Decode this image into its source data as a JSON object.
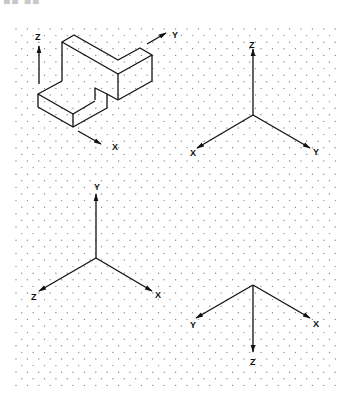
{
  "header": {
    "title_fragment": "■■ ■■"
  },
  "colors": {
    "ink": "#111111",
    "grid_dot": "#8a8a8a",
    "background": "#ffffff"
  },
  "figure": {
    "object_view": {
      "description": "isometric view of stepped block with axes",
      "axes": [
        {
          "name": "z-axis",
          "label": "Z",
          "direction": "up"
        },
        {
          "name": "y-axis",
          "label": "Y",
          "direction": "back-right"
        },
        {
          "name": "x-axis",
          "label": "X",
          "direction": "front-right"
        }
      ]
    },
    "axis_sets": [
      {
        "name": "top-right-triad",
        "labels": {
          "up": "Z",
          "left": "X",
          "right": "Y"
        }
      },
      {
        "name": "bottom-left-triad",
        "labels": {
          "up": "Y",
          "left": "Z",
          "right": "X"
        }
      },
      {
        "name": "bottom-right-triad",
        "labels": {
          "down": "Z",
          "left": "Y",
          "right": "X"
        }
      }
    ]
  }
}
